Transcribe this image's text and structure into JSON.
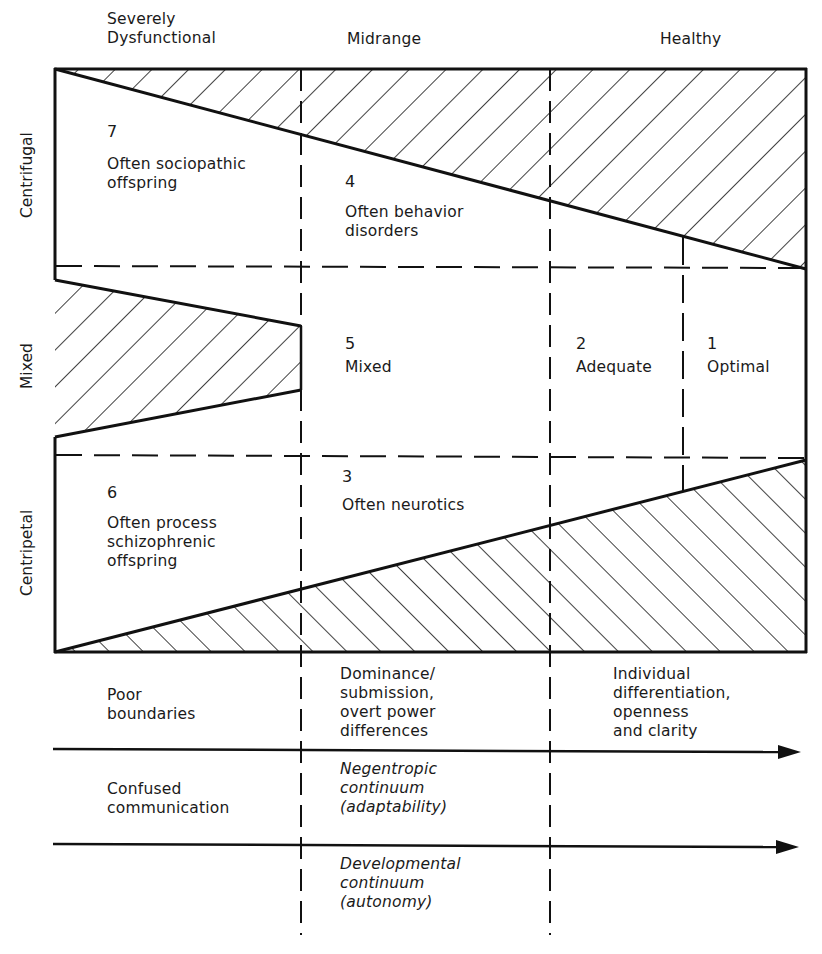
{
  "columns": {
    "severely_dysfunctional": "Severely\nDysfunctional",
    "midrange": "Midrange",
    "healthy": "Healthy"
  },
  "rows": {
    "centrifugal": "Centrifugal",
    "mixed": "Mixed",
    "centripetal": "Centripetal"
  },
  "cells": [
    {
      "number": "7",
      "label": "Often sociopathic\noffspring"
    },
    {
      "number": "4",
      "label": "Often behavior\ndisorders"
    },
    {
      "number": "5",
      "label": "Mixed"
    },
    {
      "number": "2",
      "label": "Adequate"
    },
    {
      "number": "1",
      "label": "Optimal"
    },
    {
      "number": "6",
      "label": "Often process\nschizophrenic\noffspring"
    },
    {
      "number": "3",
      "label": "Often neurotics"
    }
  ],
  "continua": {
    "row1": {
      "left": "Poor\nboundaries",
      "middle": "Dominance/\nsubmission,\novert power\ndifferences",
      "right": "Individual\ndifferentiation,\nopenness\nand clarity"
    },
    "row2": {
      "left": "Confused\ncommunication",
      "middle": "Negentropic\ncontinuum\n(adaptability)"
    },
    "row3": {
      "middle": "Developmental\ncontinuum\n(autonomy)"
    }
  },
  "colors": {
    "ink": "#111111",
    "background": "#ffffff"
  }
}
